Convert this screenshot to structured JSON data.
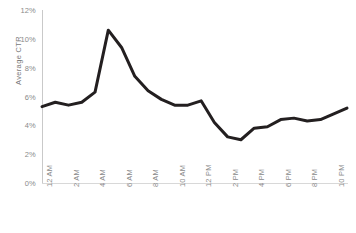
{
  "chart_data": {
    "type": "line",
    "title": "",
    "xlabel": "",
    "ylabel": "Average CTR",
    "ylim": [
      0,
      12
    ],
    "ytick_labels": [
      "0%",
      "2%",
      "4%",
      "6%",
      "8%",
      "10%",
      "12%"
    ],
    "ytick_values": [
      0,
      2,
      4,
      6,
      8,
      10,
      12
    ],
    "grid": false,
    "legend": "none",
    "line_color": "#231f20",
    "line_width": 3,
    "markers": false,
    "x": [
      "12 AM",
      "1 AM",
      "2 AM",
      "3 AM",
      "4 AM",
      "5 AM",
      "6 AM",
      "7 AM",
      "8 AM",
      "9 AM",
      "10 AM",
      "11 AM",
      "12 PM",
      "1 PM",
      "2 PM",
      "3 PM",
      "4 PM",
      "5 PM",
      "6 PM",
      "7 PM",
      "8 PM",
      "9 PM",
      "10 PM",
      "11 PM"
    ],
    "xtick_labels": [
      "12 AM",
      "2 AM",
      "4 AM",
      "6 AM",
      "8 AM",
      "10 AM",
      "12 PM",
      "2 PM",
      "4 PM",
      "6 PM",
      "8 PM",
      "10 PM"
    ],
    "xtick_indices": [
      0,
      2,
      4,
      6,
      8,
      10,
      12,
      14,
      16,
      18,
      20,
      22
    ],
    "values": [
      5.3,
      5.6,
      5.4,
      5.6,
      6.3,
      10.6,
      9.4,
      7.4,
      6.4,
      5.8,
      5.4,
      5.4,
      5.7,
      4.2,
      3.2,
      3.0,
      3.8,
      3.9,
      4.4,
      4.5,
      4.3,
      4.4,
      4.8,
      5.2
    ],
    "series_name": "Average CTR"
  }
}
